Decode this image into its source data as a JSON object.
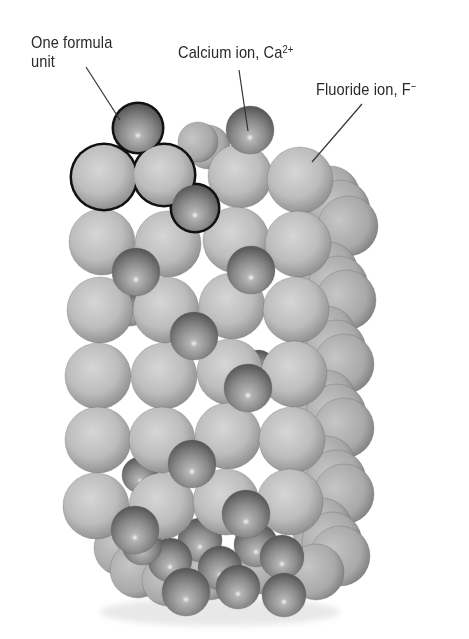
{
  "diagram": {
    "labels": {
      "formula_unit": {
        "line1": "One formula",
        "line2": "unit"
      },
      "calcium": {
        "text": "Calcium ion, Ca",
        "superscript": "2+"
      },
      "fluoride": {
        "text": "Fluoride ion, F",
        "superscript": "−"
      }
    },
    "colors": {
      "fluoride_light": "#d2d2d2",
      "fluoride_mid": "#b0b0b0",
      "fluoride_dark": "#8a8a8a",
      "calcium_light": "#c8c8c8",
      "calcium_mid": "#8c8c8c",
      "calcium_dark": "#5a5a5a",
      "outline": "#111111",
      "leader_line": "#333333"
    },
    "leaders": [
      {
        "name": "formula-unit-leader",
        "x1": 86,
        "y1": 67,
        "x2": 120,
        "y2": 120
      },
      {
        "name": "calcium-leader",
        "x1": 239,
        "y1": 70,
        "x2": 248,
        "y2": 131
      },
      {
        "name": "fluoride-leader",
        "x1": 362,
        "y1": 104,
        "x2": 312,
        "y2": 162
      }
    ],
    "formula_unit_outline": {
      "ca_top": {
        "cx": 138,
        "cy": 128,
        "r": 25
      },
      "f_left": {
        "cx": 104,
        "cy": 177,
        "r": 33
      },
      "f_right": {
        "cx": 164,
        "cy": 175,
        "r": 31
      },
      "ca_bottom": {
        "cx": 195,
        "cy": 208,
        "r": 24
      }
    },
    "back_fluoride": [
      {
        "cx": 330,
        "cy": 196,
        "r": 30
      },
      {
        "cx": 340,
        "cy": 210,
        "r": 30
      },
      {
        "cx": 348,
        "cy": 226,
        "r": 30
      },
      {
        "cx": 328,
        "cy": 272,
        "r": 30
      },
      {
        "cx": 338,
        "cy": 286,
        "r": 30
      },
      {
        "cx": 346,
        "cy": 300,
        "r": 30
      },
      {
        "cx": 326,
        "cy": 336,
        "r": 30
      },
      {
        "cx": 336,
        "cy": 350,
        "r": 30
      },
      {
        "cx": 344,
        "cy": 364,
        "r": 30
      },
      {
        "cx": 326,
        "cy": 400,
        "r": 30
      },
      {
        "cx": 336,
        "cy": 414,
        "r": 30
      },
      {
        "cx": 344,
        "cy": 428,
        "r": 30
      },
      {
        "cx": 326,
        "cy": 466,
        "r": 30
      },
      {
        "cx": 336,
        "cy": 480,
        "r": 30
      },
      {
        "cx": 344,
        "cy": 494,
        "r": 30
      },
      {
        "cx": 322,
        "cy": 528,
        "r": 30
      },
      {
        "cx": 332,
        "cy": 542,
        "r": 30
      },
      {
        "cx": 340,
        "cy": 556,
        "r": 30
      },
      {
        "cx": 316,
        "cy": 572,
        "r": 28
      },
      {
        "cx": 122,
        "cy": 548,
        "r": 28
      },
      {
        "cx": 138,
        "cy": 570,
        "r": 28
      },
      {
        "cx": 168,
        "cy": 580,
        "r": 26
      },
      {
        "cx": 210,
        "cy": 572,
        "r": 28
      },
      {
        "cx": 262,
        "cy": 566,
        "r": 28
      },
      {
        "cx": 208,
        "cy": 147,
        "r": 22
      },
      {
        "cx": 198,
        "cy": 142,
        "r": 20
      }
    ],
    "back_calcium": [
      {
        "cx": 140,
        "cy": 475,
        "r": 18
      },
      {
        "cx": 258,
        "cy": 368,
        "r": 18
      },
      {
        "cx": 130,
        "cy": 308,
        "r": 18
      },
      {
        "cx": 200,
        "cy": 540,
        "r": 22
      },
      {
        "cx": 256,
        "cy": 545,
        "r": 22
      },
      {
        "cx": 170,
        "cy": 560,
        "r": 22
      },
      {
        "cx": 220,
        "cy": 568,
        "r": 22
      },
      {
        "cx": 282,
        "cy": 557,
        "r": 22
      },
      {
        "cx": 186,
        "cy": 592,
        "r": 24
      },
      {
        "cx": 238,
        "cy": 587,
        "r": 22
      },
      {
        "cx": 284,
        "cy": 595,
        "r": 22
      },
      {
        "cx": 142,
        "cy": 545,
        "r": 20
      }
    ],
    "front_fluoride": [
      {
        "cx": 104,
        "cy": 177,
        "r": 33
      },
      {
        "cx": 164,
        "cy": 175,
        "r": 31
      },
      {
        "cx": 240,
        "cy": 176,
        "r": 32
      },
      {
        "cx": 300,
        "cy": 180,
        "r": 33
      },
      {
        "cx": 102,
        "cy": 242,
        "r": 33
      },
      {
        "cx": 168,
        "cy": 244,
        "r": 33
      },
      {
        "cx": 236,
        "cy": 240,
        "r": 33
      },
      {
        "cx": 298,
        "cy": 244,
        "r": 33
      },
      {
        "cx": 100,
        "cy": 310,
        "r": 33
      },
      {
        "cx": 166,
        "cy": 310,
        "r": 33
      },
      {
        "cx": 232,
        "cy": 306,
        "r": 33
      },
      {
        "cx": 296,
        "cy": 310,
        "r": 33
      },
      {
        "cx": 98,
        "cy": 376,
        "r": 33
      },
      {
        "cx": 164,
        "cy": 376,
        "r": 33
      },
      {
        "cx": 230,
        "cy": 372,
        "r": 33
      },
      {
        "cx": 294,
        "cy": 374,
        "r": 33
      },
      {
        "cx": 98,
        "cy": 440,
        "r": 33
      },
      {
        "cx": 162,
        "cy": 440,
        "r": 33
      },
      {
        "cx": 228,
        "cy": 436,
        "r": 33
      },
      {
        "cx": 292,
        "cy": 440,
        "r": 33
      },
      {
        "cx": 96,
        "cy": 506,
        "r": 33
      },
      {
        "cx": 162,
        "cy": 506,
        "r": 33
      },
      {
        "cx": 226,
        "cy": 502,
        "r": 33
      },
      {
        "cx": 290,
        "cy": 502,
        "r": 33
      }
    ],
    "front_calcium": [
      {
        "cx": 138,
        "cy": 128,
        "r": 25
      },
      {
        "cx": 250,
        "cy": 130,
        "r": 24
      },
      {
        "cx": 195,
        "cy": 208,
        "r": 24
      },
      {
        "cx": 136,
        "cy": 272,
        "r": 24
      },
      {
        "cx": 251,
        "cy": 270,
        "r": 24
      },
      {
        "cx": 194,
        "cy": 336,
        "r": 24
      },
      {
        "cx": 248,
        "cy": 388,
        "r": 24
      },
      {
        "cx": 192,
        "cy": 464,
        "r": 24
      },
      {
        "cx": 135,
        "cy": 530,
        "r": 24
      },
      {
        "cx": 246,
        "cy": 514,
        "r": 24
      }
    ]
  }
}
